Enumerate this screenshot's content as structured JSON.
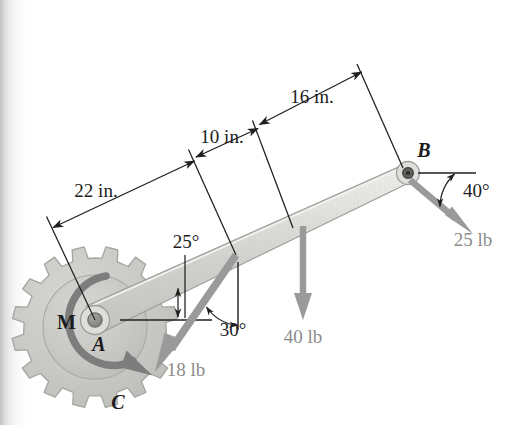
{
  "figure": {
    "type": "engineering-free-body-diagram",
    "background_color": "#ffffff",
    "page_edge_shadow": true
  },
  "dimensions": [
    {
      "id": "dim-22",
      "label": "22 in.",
      "value": 22,
      "unit": "in.",
      "from": "A",
      "to": "load-18lb-point"
    },
    {
      "id": "dim-10",
      "label": "10 in.",
      "value": 10,
      "unit": "in.",
      "from": "load-18lb-point",
      "to": "load-40lb-point"
    },
    {
      "id": "dim-16",
      "label": "16 in.",
      "value": 16,
      "unit": "in.",
      "from": "load-40lb-point",
      "to": "B"
    }
  ],
  "angles": [
    {
      "id": "angle-25",
      "label": "25°",
      "value": 25,
      "unit": "deg",
      "description": "beam inclination from horizontal at A"
    },
    {
      "id": "angle-30",
      "label": "30°",
      "value": 30,
      "unit": "deg",
      "description": "18 lb force from vertical"
    },
    {
      "id": "angle-40",
      "label": "40°",
      "value": 40,
      "unit": "deg",
      "description": "25 lb force below horizontal at B"
    }
  ],
  "forces": [
    {
      "id": "force-18",
      "label": "18 lb",
      "magnitude": 18,
      "unit": "lb",
      "direction": "down-left at 30 deg from vertical",
      "color": "#9a9a9a"
    },
    {
      "id": "force-40",
      "label": "40 lb",
      "magnitude": 40,
      "unit": "lb",
      "direction": "vertically downward",
      "color": "#9a9a9a"
    },
    {
      "id": "force-25",
      "label": "25 lb",
      "magnitude": 25,
      "unit": "lb",
      "direction": "down-right at 40 deg below horizontal",
      "color": "#9a9a9a"
    }
  ],
  "moments": [
    {
      "id": "moment-M",
      "label": "M",
      "sense": "clockwise",
      "applied_at": "gear C / point A",
      "color": "#7d7d7d"
    }
  ],
  "points": [
    {
      "id": "point-A",
      "label": "A",
      "style": "italic",
      "description": "pin at left end of beam, center of gear"
    },
    {
      "id": "point-B",
      "label": "B",
      "style": "italic",
      "description": "pin at right end of beam"
    },
    {
      "id": "point-C",
      "label": "C",
      "style": "italic",
      "description": "gear body label"
    }
  ],
  "members": [
    {
      "id": "beam-AB",
      "from": "A",
      "to": "B",
      "style": "tapered-gray-bar",
      "fill": "#d7d7d4",
      "stroke": "#9b9b99"
    },
    {
      "id": "gear-C",
      "teeth": 18,
      "fill": "#c9c9c6",
      "stroke": "#a2a29f"
    }
  ],
  "colors": {
    "line": "#1f1f1f",
    "force_gray": "#9a9a9a",
    "gear_fill": "#c9c9c6",
    "gear_stroke": "#a2a29f",
    "beam_fill": "#d9d9d6",
    "beam_stroke": "#9b9b99",
    "moment_gray": "#7d7d7d"
  }
}
